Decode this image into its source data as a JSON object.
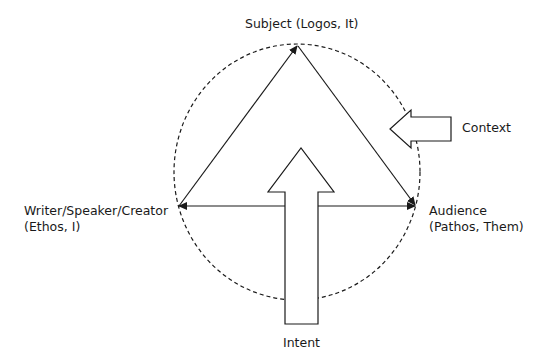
{
  "diagram": {
    "nodes": {
      "subject": {
        "line1": "Subject (Logos, It)"
      },
      "writer": {
        "line1": "Writer/Speaker/Creator",
        "line2": "(Ethos, I)"
      },
      "audience": {
        "line1": "Audience",
        "line2": "(Pathos, Them)"
      }
    },
    "forces": {
      "context": {
        "label": "Context"
      },
      "intent": {
        "label": "Intent"
      }
    },
    "edges": [
      {
        "from": "writer",
        "to": "subject",
        "arrow": "to"
      },
      {
        "from": "subject",
        "to": "audience",
        "arrow": "to"
      },
      {
        "from": "writer",
        "to": "audience",
        "arrow": "both"
      }
    ],
    "boundary": {
      "shape": "dashed-circle"
    },
    "colors": {
      "stroke": "#1a1a1a",
      "background": "#ffffff"
    }
  }
}
